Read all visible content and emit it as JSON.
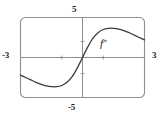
{
  "figure": {
    "name": "graph-of-second-derivative",
    "background_color": "#ffffff",
    "frame_color": "#8a8a8a",
    "axis_color": "#8a8a8a",
    "curve_color": "#3a3a3a"
  },
  "labels": {
    "y_max": "5",
    "y_min": "-5",
    "x_min": "-3",
    "x_max": "3",
    "curve_base": "f",
    "curve_prime": "″"
  },
  "chart_data": {
    "type": "line",
    "title": "",
    "subtitle": "",
    "xlabel": "",
    "ylabel": "",
    "xlim": [
      -3,
      3
    ],
    "ylim": [
      -5,
      5
    ],
    "grid": false,
    "legend_position": "inline-annotation",
    "xticks": [
      -3,
      -2,
      -1,
      0,
      1,
      2,
      3
    ],
    "xtick_labels": [
      "-3",
      "",
      "",
      "",
      "",
      "",
      "3"
    ],
    "yticks": [
      -5,
      -4,
      -3,
      -2,
      -1,
      0,
      1,
      2,
      3,
      4,
      5
    ],
    "ytick_labels": [
      "-5",
      "",
      "",
      "",
      "",
      "",
      "",
      "",
      "",
      "",
      "5"
    ],
    "annotations": [
      {
        "text": "f″",
        "x": 1.0,
        "y": 2.1
      }
    ],
    "series": [
      {
        "name": "f″",
        "color": "#3a3a3a",
        "x": [
          -3.0,
          -2.75,
          -2.5,
          -2.25,
          -2.0,
          -1.75,
          -1.5,
          -1.25,
          -1.0,
          -0.75,
          -0.5,
          -0.25,
          0.0,
          0.25,
          0.5,
          0.75,
          1.0,
          1.25,
          1.5,
          1.75,
          2.0,
          2.25,
          2.5,
          2.75,
          3.0
        ],
        "values": [
          -2.2,
          -2.5,
          -2.8,
          -3.1,
          -3.35,
          -3.55,
          -3.65,
          -3.65,
          -3.5,
          -3.1,
          -2.4,
          -1.3,
          0.0,
          1.3,
          2.4,
          3.1,
          3.5,
          3.65,
          3.65,
          3.55,
          3.35,
          3.1,
          2.8,
          2.5,
          2.2
        ]
      }
    ],
    "features": {
      "local_minimum": {
        "x": -1.15,
        "y": -3.66
      },
      "local_maximum": {
        "x": 1.15,
        "y": 3.66
      },
      "inflection_origin": {
        "x": 0,
        "y": 0
      },
      "symmetry": "odd"
    }
  },
  "ticks": {
    "x_axis_marks": [
      -2,
      2
    ],
    "y_axis_marks": [
      -2,
      2
    ]
  }
}
